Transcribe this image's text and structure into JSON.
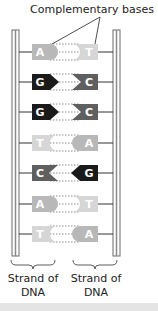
{
  "title": "Complementary bases",
  "colors": {
    "A": "#b8b8b8",
    "T": "#d6d6d6",
    "G": "#1a1a1a",
    "C": "#5f5f5f",
    "strand": "#6a6a6a"
  },
  "pairs": [
    {
      "left": "A",
      "right": "T"
    },
    {
      "left": "G",
      "right": "C"
    },
    {
      "left": "G",
      "right": "C"
    },
    {
      "left": "T",
      "right": "A"
    },
    {
      "left": "C",
      "right": "G"
    },
    {
      "left": "A",
      "right": "T"
    },
    {
      "left": "T",
      "right": "A"
    }
  ],
  "labels": {
    "left_strand": "Strand of DNA",
    "right_strand": "Strand of DNA"
  }
}
